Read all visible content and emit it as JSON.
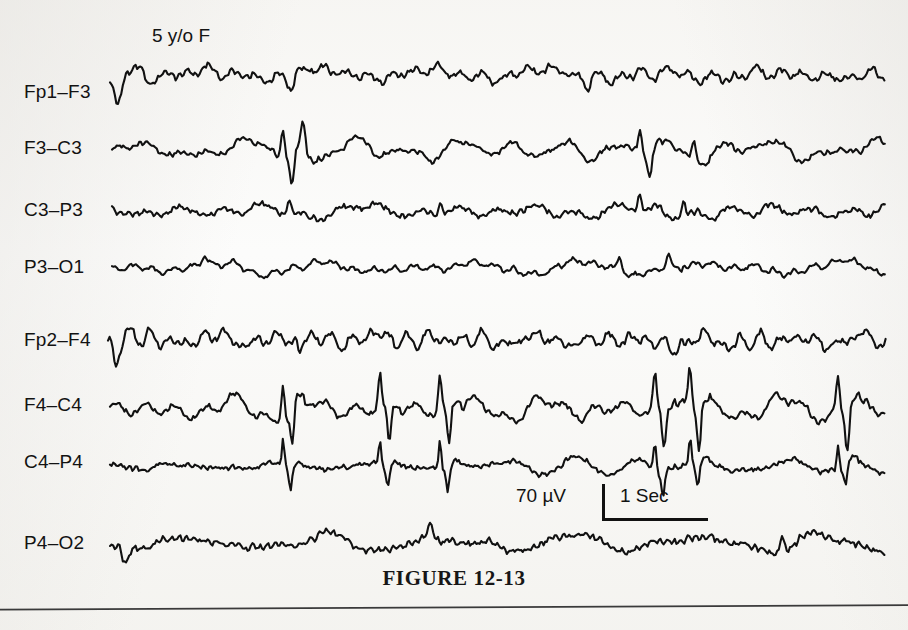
{
  "figure": {
    "caption": "FIGURE 12-13",
    "patient_annotation": "5 y/o F",
    "background_color": "#fbfbfa",
    "trace_color": "#111111",
    "width": 908,
    "height": 630
  },
  "calibration": {
    "amplitude_label": "70 µV",
    "time_label": "1 Sec",
    "amplitude_value": 70,
    "amplitude_unit": "µV",
    "time_value": 1,
    "time_unit": "Sec"
  },
  "chart_data": {
    "type": "line",
    "title": "FIGURE 12-13",
    "subtitle": "5 y/o F",
    "xlabel": "Time",
    "ylabel": "Channel (bipolar longitudinal montage)",
    "grid": false,
    "legend": "none",
    "x_scale_bar_seconds": 1,
    "y_scale_bar_microvolts": 70,
    "x_range_px": [
      108,
      886
    ],
    "series": [
      {
        "name": "Fp1–F3",
        "label_x": 24,
        "label_y": 92,
        "baseline_y": 75,
        "trace_start_x": 110,
        "amplitude": 9,
        "noise": 4.2,
        "seed": 1171,
        "spikes": [
          {
            "x": 118,
            "amp": -34,
            "width": 9
          },
          {
            "x": 291,
            "amp": -15,
            "width": 7
          },
          {
            "x": 588,
            "amp": -12,
            "width": 6
          }
        ]
      },
      {
        "name": "F3–C3",
        "label_x": 24,
        "label_y": 148,
        "baseline_y": 150,
        "trace_start_x": 112,
        "amplitude": 8,
        "noise": 3.4,
        "seed": 2293,
        "spikes": [
          {
            "x": 283,
            "amp": 30,
            "width": 4
          },
          {
            "x": 292,
            "amp": -24,
            "width": 5
          },
          {
            "x": 303,
            "amp": 22,
            "width": 5
          },
          {
            "x": 640,
            "amp": 26,
            "width": 4
          },
          {
            "x": 650,
            "amp": -20,
            "width": 4
          },
          {
            "x": 694,
            "amp": 18,
            "width": 5
          }
        ]
      },
      {
        "name": "C3–P3",
        "label_x": 24,
        "label_y": 210,
        "baseline_y": 211,
        "trace_start_x": 112,
        "amplitude": 6,
        "noise": 4.0,
        "seed": 3371,
        "spikes": [
          {
            "x": 289,
            "amp": 14,
            "width": 4
          },
          {
            "x": 441,
            "amp": 13,
            "width": 4
          },
          {
            "x": 640,
            "amp": 16,
            "width": 4
          },
          {
            "x": 684,
            "amp": 14,
            "width": 4
          }
        ]
      },
      {
        "name": "P3–O1",
        "label_x": 24,
        "label_y": 267,
        "baseline_y": 268,
        "trace_start_x": 112,
        "amplitude": 7,
        "noise": 2.6,
        "seed": 4457,
        "spikes": [
          {
            "x": 205,
            "amp": 11,
            "width": 6
          },
          {
            "x": 620,
            "amp": 15,
            "width": 5
          },
          {
            "x": 668,
            "amp": 13,
            "width": 5
          }
        ]
      },
      {
        "name": "Fp2–F4",
        "label_x": 24,
        "label_y": 340,
        "baseline_y": 340,
        "trace_start_x": 108,
        "amplitude": 8,
        "noise": 4.4,
        "seed": 5531,
        "spikes": [
          {
            "x": 116,
            "amp": -26,
            "width": 8
          },
          {
            "x": 300,
            "amp": -12,
            "width": 6
          },
          {
            "x": 686,
            "amp": -13,
            "width": 6
          }
        ]
      },
      {
        "name": "F4–C4",
        "label_x": 24,
        "label_y": 405,
        "baseline_y": 409,
        "trace_start_x": 110,
        "amplitude": 11,
        "noise": 4.0,
        "seed": 6619,
        "spikes": [
          {
            "x": 283,
            "amp": 36,
            "width": 4
          },
          {
            "x": 292,
            "amp": -32,
            "width": 4
          },
          {
            "x": 380,
            "amp": 34,
            "width": 4
          },
          {
            "x": 389,
            "amp": -30,
            "width": 4
          },
          {
            "x": 440,
            "amp": 36,
            "width": 4
          },
          {
            "x": 449,
            "amp": -32,
            "width": 4
          },
          {
            "x": 655,
            "amp": 38,
            "width": 4
          },
          {
            "x": 664,
            "amp": -30,
            "width": 4
          },
          {
            "x": 690,
            "amp": 36,
            "width": 4
          },
          {
            "x": 699,
            "amp": -32,
            "width": 4
          },
          {
            "x": 838,
            "amp": 34,
            "width": 4
          },
          {
            "x": 847,
            "amp": -30,
            "width": 4
          }
        ]
      },
      {
        "name": "C4–P4",
        "label_x": 24,
        "label_y": 462,
        "baseline_y": 466,
        "trace_start_x": 110,
        "amplitude": 7,
        "noise": 3.4,
        "seed": 7723,
        "spikes": [
          {
            "x": 283,
            "amp": 26,
            "width": 3
          },
          {
            "x": 291,
            "amp": -22,
            "width": 4
          },
          {
            "x": 380,
            "amp": 24,
            "width": 3
          },
          {
            "x": 388,
            "amp": -20,
            "width": 4
          },
          {
            "x": 440,
            "amp": 26,
            "width": 3
          },
          {
            "x": 448,
            "amp": -22,
            "width": 4
          },
          {
            "x": 655,
            "amp": 26,
            "width": 3
          },
          {
            "x": 663,
            "amp": -22,
            "width": 4
          },
          {
            "x": 690,
            "amp": 25,
            "width": 3
          },
          {
            "x": 698,
            "amp": -21,
            "width": 4
          },
          {
            "x": 838,
            "amp": 24,
            "width": 3
          },
          {
            "x": 846,
            "amp": -20,
            "width": 4
          }
        ]
      },
      {
        "name": "P4–O2",
        "label_x": 24,
        "label_y": 543,
        "baseline_y": 543,
        "trace_start_x": 110,
        "amplitude": 8,
        "noise": 4.6,
        "seed": 8837,
        "spikes": [
          {
            "x": 125,
            "amp": -14,
            "width": 7
          },
          {
            "x": 430,
            "amp": 15,
            "width": 5
          },
          {
            "x": 782,
            "amp": 14,
            "width": 5
          }
        ]
      }
    ]
  }
}
